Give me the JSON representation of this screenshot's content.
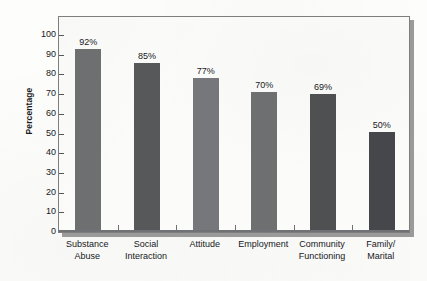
{
  "chart_data": {
    "type": "bar",
    "title": "",
    "subtitle": "",
    "xlabel": "",
    "ylabel": "Percentage",
    "ylim": [
      0,
      100
    ],
    "ytick_step": 10,
    "ytick_labels": [
      "100",
      "90",
      "80",
      "70",
      "60",
      "50",
      "40",
      "30",
      "20",
      "10",
      "0"
    ],
    "yticks": [
      100,
      90,
      80,
      70,
      60,
      50,
      40,
      30,
      20,
      10,
      0
    ],
    "grid": false,
    "legend": null,
    "categories": [
      "Substance Abuse",
      "Social Interaction",
      "Attitude",
      "Employment",
      "Community Functioning",
      "Family/ Marital"
    ],
    "category_lines": [
      [
        "Substance",
        "Abuse"
      ],
      [
        "Social",
        "Interaction"
      ],
      [
        "Attitude",
        ""
      ],
      [
        "Employment",
        ""
      ],
      [
        "Community",
        "Functioning"
      ],
      [
        "Family/",
        "Marital"
      ]
    ],
    "values": [
      92,
      85,
      77,
      70,
      69,
      50
    ],
    "data_labels": [
      "92%",
      "85%",
      "77%",
      "70%",
      "69%",
      "50%"
    ],
    "bar_colors": [
      "#6d6f71",
      "#56585a",
      "#75777a",
      "#6d6f71",
      "#4e5052",
      "#45474a"
    ]
  },
  "colors": {
    "page_background": "#fdfdfc",
    "plot_background": "#fbfbfa",
    "plot_border": "#7e7e7e",
    "plot_shadow": "#9a9a9a",
    "axis": "#6f7174",
    "text": "#16181a"
  }
}
